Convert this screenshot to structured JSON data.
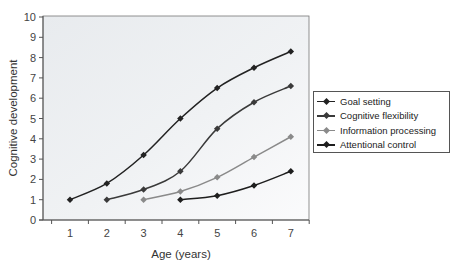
{
  "chart_data": {
    "type": "line",
    "title": "",
    "xlabel": "Age (years)",
    "ylabel": "Cognitive development",
    "x": [
      1,
      2,
      3,
      4,
      5,
      6,
      7
    ],
    "xlim": [
      0.25,
      7.45
    ],
    "ylim": [
      0,
      10
    ],
    "yticks": [
      0,
      1,
      2,
      3,
      4,
      5,
      6,
      7,
      8,
      9,
      10
    ],
    "xticks": [
      1,
      2,
      3,
      4,
      5,
      6,
      7
    ],
    "grid": false,
    "legend_position": "right",
    "series": [
      {
        "name": "Goal setting",
        "color": "#222222",
        "x": [
          1,
          2,
          3,
          4,
          5,
          6,
          7
        ],
        "values": [
          1.0,
          1.8,
          3.2,
          5.0,
          6.5,
          7.5,
          8.3
        ]
      },
      {
        "name": "Cognitive flexibility",
        "color": "#3a3a3a",
        "x": [
          2,
          3,
          4,
          5,
          6,
          7
        ],
        "values": [
          1.0,
          1.5,
          2.4,
          4.5,
          5.8,
          6.6
        ]
      },
      {
        "name": "Information processing",
        "color": "#8a8a8a",
        "x": [
          3,
          4,
          5,
          6,
          7
        ],
        "values": [
          1.0,
          1.4,
          2.1,
          3.1,
          4.1
        ]
      },
      {
        "name": "Attentional control",
        "color": "#1e1e1e",
        "x": [
          4,
          5,
          6,
          7
        ],
        "values": [
          1.0,
          1.2,
          1.7,
          2.4
        ]
      }
    ]
  },
  "legend": {
    "items": [
      {
        "label": "Goal setting",
        "color": "#222222"
      },
      {
        "label": "Cognitive flexibility",
        "color": "#3a3a3a"
      },
      {
        "label": "Information processing",
        "color": "#8a8a8a"
      },
      {
        "label": "Attentional control",
        "color": "#1e1e1e"
      }
    ]
  },
  "colors": {
    "plot_background": "#eceff1",
    "axis": "#555555"
  }
}
